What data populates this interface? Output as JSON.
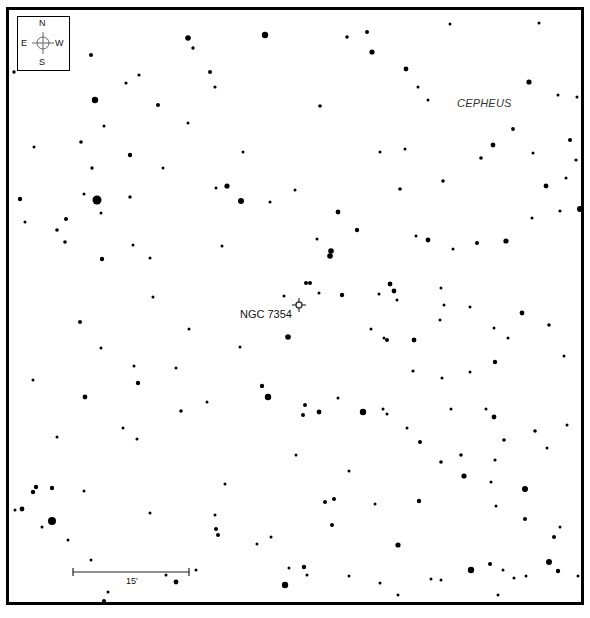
{
  "chart": {
    "frame_color": "#000000",
    "background": "#ffffff"
  },
  "compass": {
    "north": "N",
    "south": "S",
    "east": "E",
    "west": "W"
  },
  "labels": {
    "object": "NGC 7354",
    "constellation": "CEPHEUS",
    "scale": "15'"
  },
  "stars": [
    [
      188,
      38,
      2.8
    ],
    [
      265,
      35,
      3.2
    ],
    [
      193,
      48,
      1.7
    ],
    [
      14,
      72,
      1.7
    ],
    [
      91,
      55,
      2.0
    ],
    [
      347,
      37,
      1.8
    ],
    [
      367,
      32,
      2.0
    ],
    [
      372,
      52,
      2.6
    ],
    [
      450,
      24,
      1.5
    ],
    [
      539,
      23,
      1.5
    ],
    [
      406,
      69,
      2.4
    ],
    [
      210,
      72,
      2.0
    ],
    [
      215,
      87,
      1.6
    ],
    [
      139,
      75,
      1.6
    ],
    [
      126,
      83,
      1.6
    ],
    [
      95,
      100,
      3.2
    ],
    [
      158,
      105,
      2.0
    ],
    [
      188,
      123,
      1.5
    ],
    [
      104,
      126,
      1.5
    ],
    [
      320,
      106,
      1.8
    ],
    [
      418,
      87,
      1.5
    ],
    [
      428,
      100,
      1.5
    ],
    [
      529,
      82,
      2.6
    ],
    [
      558,
      95,
      1.5
    ],
    [
      577,
      97,
      1.5
    ],
    [
      513,
      129,
      1.9
    ],
    [
      493,
      145,
      2.4
    ],
    [
      481,
      158,
      1.8
    ],
    [
      576,
      160,
      1.6
    ],
    [
      533,
      153,
      1.5
    ],
    [
      81,
      142,
      1.8
    ],
    [
      130,
      155,
      2.2
    ],
    [
      34,
      147,
      1.5
    ],
    [
      92,
      168,
      1.7
    ],
    [
      163,
      168,
      1.5
    ],
    [
      243,
      152,
      1.5
    ],
    [
      405,
      149,
      1.5
    ],
    [
      400,
      189,
      1.8
    ],
    [
      443,
      181,
      1.8
    ],
    [
      546,
      186,
      2.4
    ],
    [
      566,
      178,
      1.5
    ],
    [
      20,
      199,
      2.2
    ],
    [
      84,
      194,
      1.5
    ],
    [
      97,
      200,
      4.5
    ],
    [
      130,
      197,
      1.7
    ],
    [
      101,
      213,
      1.5
    ],
    [
      227,
      186,
      2.6
    ],
    [
      216,
      188,
      1.5
    ],
    [
      241,
      201,
      3.0
    ],
    [
      270,
      202,
      1.5
    ],
    [
      295,
      190,
      1.5
    ],
    [
      338,
      212,
      2.4
    ],
    [
      357,
      230,
      2.2
    ],
    [
      380,
      152,
      1.5
    ],
    [
      416,
      236,
      1.5
    ],
    [
      428,
      240,
      2.4
    ],
    [
      580,
      209,
      3.0
    ],
    [
      560,
      211,
      1.6
    ],
    [
      532,
      218,
      1.5
    ],
    [
      25,
      222,
      1.5
    ],
    [
      66,
      219,
      2.0
    ],
    [
      57,
      230,
      1.8
    ],
    [
      65,
      242,
      1.8
    ],
    [
      133,
      245,
      1.5
    ],
    [
      222,
      246,
      1.5
    ],
    [
      331,
      251,
      2.8
    ],
    [
      330,
      256,
      2.8
    ],
    [
      317,
      239,
      1.5
    ],
    [
      453,
      249,
      1.5
    ],
    [
      477,
      243,
      2.0
    ],
    [
      506,
      241,
      2.6
    ],
    [
      102,
      259,
      2.2
    ],
    [
      150,
      258,
      1.5
    ],
    [
      306,
      283,
      2.0
    ],
    [
      310,
      283,
      2.0
    ],
    [
      284,
      296,
      1.5
    ],
    [
      319,
      293,
      1.5
    ],
    [
      342,
      295,
      2.2
    ],
    [
      379,
      294,
      1.5
    ],
    [
      390,
      284,
      2.4
    ],
    [
      394,
      291,
      2.4
    ],
    [
      397,
      300,
      1.5
    ],
    [
      441,
      288,
      1.5
    ],
    [
      444,
      305,
      1.5
    ],
    [
      470,
      307,
      1.5
    ],
    [
      522,
      313,
      2.4
    ],
    [
      440,
      320,
      1.5
    ],
    [
      153,
      297,
      1.5
    ],
    [
      189,
      329,
      1.5
    ],
    [
      80,
      322,
      2.0
    ],
    [
      288,
      337,
      2.8
    ],
    [
      371,
      329,
      1.5
    ],
    [
      384,
      338,
      1.5
    ],
    [
      387,
      340,
      2.0
    ],
    [
      414,
      340,
      2.4
    ],
    [
      494,
      328,
      1.5
    ],
    [
      549,
      325,
      1.8
    ],
    [
      101,
      348,
      1.5
    ],
    [
      240,
      347,
      1.5
    ],
    [
      134,
      366,
      1.5
    ],
    [
      138,
      383,
      2.2
    ],
    [
      176,
      368,
      1.5
    ],
    [
      33,
      380,
      1.5
    ],
    [
      85,
      397,
      2.4
    ],
    [
      181,
      411,
      1.8
    ],
    [
      207,
      402,
      1.5
    ],
    [
      262,
      386,
      2.2
    ],
    [
      268,
      397,
      3.2
    ],
    [
      305,
      405,
      2.0
    ],
    [
      303,
      415,
      2.0
    ],
    [
      319,
      412,
      2.4
    ],
    [
      338,
      398,
      1.5
    ],
    [
      363,
      412,
      3.2
    ],
    [
      383,
      409,
      1.5
    ],
    [
      387,
      414,
      1.5
    ],
    [
      413,
      371,
      1.6
    ],
    [
      442,
      378,
      1.5
    ],
    [
      470,
      372,
      1.5
    ],
    [
      495,
      362,
      2.2
    ],
    [
      508,
      338,
      1.5
    ],
    [
      564,
      356,
      1.5
    ],
    [
      407,
      428,
      1.5
    ],
    [
      420,
      442,
      2.0
    ],
    [
      451,
      409,
      1.5
    ],
    [
      486,
      409,
      1.5
    ],
    [
      494,
      417,
      2.4
    ],
    [
      535,
      431,
      1.8
    ],
    [
      504,
      440,
      1.8
    ],
    [
      547,
      448,
      1.5
    ],
    [
      567,
      425,
      1.5
    ],
    [
      123,
      428,
      1.5
    ],
    [
      137,
      439,
      1.5
    ],
    [
      57,
      437,
      1.5
    ],
    [
      36,
      487,
      2.2
    ],
    [
      33,
      492,
      2.2
    ],
    [
      52,
      488,
      2.2
    ],
    [
      84,
      491,
      1.5
    ],
    [
      15,
      510,
      1.5
    ],
    [
      22,
      509,
      2.4
    ],
    [
      42,
      527,
      1.5
    ],
    [
      52,
      521,
      4.0
    ],
    [
      68,
      540,
      1.5
    ],
    [
      150,
      513,
      1.5
    ],
    [
      215,
      515,
      1.5
    ],
    [
      216,
      529,
      2.0
    ],
    [
      218,
      535,
      2.0
    ],
    [
      225,
      484,
      1.5
    ],
    [
      257,
      544,
      1.5
    ],
    [
      271,
      537,
      1.5
    ],
    [
      296,
      455,
      1.5
    ],
    [
      349,
      471,
      1.5
    ],
    [
      325,
      502,
      2.0
    ],
    [
      334,
      499,
      2.0
    ],
    [
      332,
      525,
      2.0
    ],
    [
      375,
      504,
      1.5
    ],
    [
      419,
      501,
      2.2
    ],
    [
      461,
      455,
      1.8
    ],
    [
      441,
      462,
      1.8
    ],
    [
      464,
      476,
      2.6
    ],
    [
      495,
      460,
      1.6
    ],
    [
      491,
      482,
      1.5
    ],
    [
      525,
      489,
      3.0
    ],
    [
      496,
      506,
      1.5
    ],
    [
      525,
      519,
      2.0
    ],
    [
      560,
      527,
      1.5
    ],
    [
      554,
      537,
      2.0
    ],
    [
      380,
      583,
      1.5
    ],
    [
      289,
      568,
      1.5
    ],
    [
      304,
      567,
      2.2
    ],
    [
      285,
      585,
      3.2
    ],
    [
      307,
      575,
      1.5
    ],
    [
      349,
      576,
      1.5
    ],
    [
      471,
      570,
      3.2
    ],
    [
      431,
      579,
      1.5
    ],
    [
      441,
      580,
      1.5
    ],
    [
      398,
      545,
      2.6
    ],
    [
      490,
      564,
      2.0
    ],
    [
      503,
      570,
      1.5
    ],
    [
      514,
      578,
      1.5
    ],
    [
      526,
      576,
      1.5
    ],
    [
      549,
      562,
      3.0
    ],
    [
      558,
      571,
      2.2
    ],
    [
      578,
      576,
      1.5
    ],
    [
      498,
      595,
      1.5
    ],
    [
      398,
      595,
      1.5
    ],
    [
      91,
      560,
      1.5
    ],
    [
      108,
      592,
      1.5
    ],
    [
      104,
      601,
      2.0
    ],
    [
      166,
      575,
      1.5
    ],
    [
      176,
      582,
      2.4
    ],
    [
      196,
      570,
      1.5
    ],
    [
      570,
      140,
      2.0
    ]
  ]
}
